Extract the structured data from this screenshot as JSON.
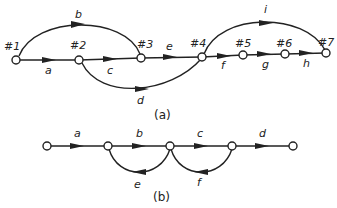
{
  "figure_a": {
    "caption": "(a)",
    "nodes": [
      {
        "id": "n1",
        "label": "#1"
      },
      {
        "id": "n2",
        "label": "#2"
      },
      {
        "id": "n3",
        "label": "#3"
      },
      {
        "id": "n4",
        "label": "#4"
      },
      {
        "id": "n5",
        "label": "#5"
      },
      {
        "id": "n6",
        "label": "#6"
      },
      {
        "id": "n7",
        "label": "#7"
      }
    ],
    "edges": [
      {
        "from": "#1",
        "to": "#2",
        "label": "a"
      },
      {
        "from": "#1",
        "to": "#3",
        "label": "b"
      },
      {
        "from": "#2",
        "to": "#3",
        "label": "c"
      },
      {
        "from": "#2",
        "to": "#4",
        "label": "d"
      },
      {
        "from": "#3",
        "to": "#4",
        "label": "e"
      },
      {
        "from": "#4",
        "to": "#5",
        "label": "f"
      },
      {
        "from": "#5",
        "to": "#6",
        "label": "g"
      },
      {
        "from": "#6",
        "to": "#7",
        "label": "h"
      },
      {
        "from": "#4",
        "to": "#7",
        "label": "i"
      }
    ]
  },
  "figure_b": {
    "caption": "(b)",
    "edges": [
      {
        "label": "a"
      },
      {
        "label": "b"
      },
      {
        "label": "c"
      },
      {
        "label": "d"
      },
      {
        "label": "e"
      },
      {
        "label": "f"
      }
    ]
  }
}
